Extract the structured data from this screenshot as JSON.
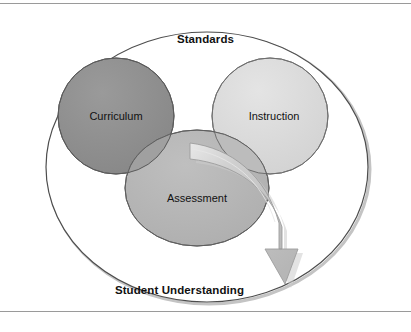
{
  "diagram": {
    "type": "venn-diagram",
    "title": "Standards",
    "outcome_label": "Student Understanding",
    "outer_set": {
      "name": "standards-ellipse",
      "label": "Standards",
      "fill": "#ffffff",
      "stroke": "#4d4d4d"
    },
    "circles": [
      {
        "name": "curriculum-circle",
        "label": "Curriculum",
        "fill": "#8e8e8e",
        "stroke": "#5a5a5a"
      },
      {
        "name": "instruction-circle",
        "label": "Instruction",
        "fill": "#dcdcdc",
        "stroke": "#6f6f6f"
      },
      {
        "name": "assessment-circle",
        "label": "Assessment",
        "fill": "#b4b4b4",
        "stroke": "#5f5f5f"
      }
    ],
    "arrow": {
      "name": "student-understanding-arrow",
      "description": "curved swoosh arrow from center intersection down to Student Understanding",
      "fill": "#c0c0c0",
      "stroke": "#9a9a9a",
      "direction": "down"
    },
    "colors": {
      "background": "#ffffff",
      "rule": "#9a9a9a",
      "text": "#111111",
      "shadow": "#b9b9b9"
    },
    "rules": {
      "top": "horizontal-rule-top",
      "bottom": "horizontal-rule-bottom"
    }
  }
}
